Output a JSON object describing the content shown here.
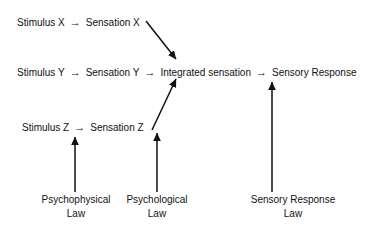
{
  "diagram": {
    "background_color": "#ffffff",
    "line_color": "#111111",
    "arrow_glyph": "→",
    "chains": [
      {
        "id": "chain-x",
        "stimulus": "Stimulus X",
        "connector": "→",
        "sensation": "Sensation X"
      },
      {
        "id": "chain-y",
        "stimulus": "Stimulus Y",
        "connector": "→",
        "sensation": "Sensation Y",
        "connector2": "→",
        "integrated": "Integrated sensation",
        "connector3": "→",
        "response": "Sensory Response"
      },
      {
        "id": "chain-z",
        "stimulus": "Stimulus Z",
        "connector": "→",
        "sensation": "Sensation Z"
      }
    ],
    "laws": [
      {
        "id": "law-psychophysical",
        "line1": "Psychophysical",
        "line2": "Law"
      },
      {
        "id": "law-psychological",
        "line1": "Psychological",
        "line2": "Law"
      },
      {
        "id": "law-sensory-response",
        "line1": "Sensory Response",
        "line2": "Law"
      }
    ]
  }
}
